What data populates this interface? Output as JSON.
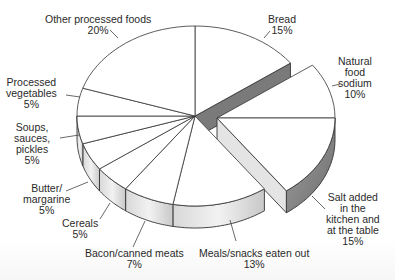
{
  "chart_data": {
    "type": "pie",
    "style": "3d-exploded",
    "title": "",
    "start_angle_deg": 0,
    "direction": "clockwise",
    "exploded": [
      "Natural food sodium",
      "Salt added in the kitchen and at the table"
    ],
    "categories": [
      "Bread",
      "Natural food sodium",
      "Salt added in the kitchen and at the table",
      "Meals/snacks eaten out",
      "Bacon/canned meats",
      "Cereals",
      "Butter/margarine",
      "Soups, sauces, pickles",
      "Processed vegetables",
      "Other processed foods"
    ],
    "values": [
      15,
      10,
      15,
      13,
      7,
      5,
      5,
      5,
      5,
      20
    ],
    "unit": "%",
    "colors": {
      "face": "#ffffff",
      "outline": "#333333",
      "side_light": "#e4e4e4",
      "side_dark": "#7a7a7a",
      "side_mid": "#bdbdbd"
    }
  },
  "labels": {
    "other": {
      "lines": [
        "Other processed foods",
        "20%"
      ]
    },
    "bread": {
      "lines": [
        "Bread",
        "15%"
      ]
    },
    "natural": {
      "lines": [
        "Natural",
        "food",
        "sodium",
        "10%"
      ]
    },
    "procveg": {
      "lines": [
        "Processed",
        "vegetables",
        "5%"
      ]
    },
    "soups": {
      "lines": [
        "Soups,",
        "sauces,",
        "pickles",
        "5%"
      ]
    },
    "butter": {
      "lines": [
        "Butter/",
        "margarine",
        "5%"
      ]
    },
    "cereals": {
      "lines": [
        "Cereals",
        "5%"
      ]
    },
    "bacon": {
      "lines": [
        "Bacon/canned meats",
        "7%"
      ]
    },
    "meals": {
      "lines": [
        "Meals/snacks eaten out",
        "13%"
      ]
    },
    "salt": {
      "lines": [
        "Salt added",
        "in the",
        "kitchen and",
        "at the table",
        "15%"
      ]
    }
  }
}
